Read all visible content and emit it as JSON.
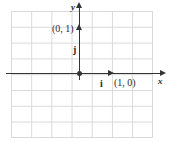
{
  "figure": {
    "type": "coordinate-plane-diagram",
    "background_color": "#ffffff",
    "grid_color": "#d9d9d9",
    "axis_color": "#333333",
    "label_color": "#2b2b2b"
  },
  "axes": {
    "x_label": "x",
    "y_label": "y",
    "x_arrow": "arrowhead-right",
    "y_arrow": "arrowhead-up",
    "origin_marker": "dot"
  },
  "labels": {
    "point_0_1": "(0, 1)",
    "point_1_0": "(1, 0)",
    "vector_i": "i",
    "vector_j": "j"
  },
  "chart_data": {
    "type": "scatter",
    "title": "",
    "xlabel": "x",
    "ylabel": "y",
    "grid": true,
    "legend": "none",
    "xlim": [
      -3.5,
      3.5
    ],
    "ylim": [
      -3,
      4
    ],
    "vectors": [
      {
        "name": "i",
        "label": "(1, 0)",
        "from": [
          0,
          0
        ],
        "to": [
          1,
          0
        ]
      },
      {
        "name": "j",
        "label": "(0, 1)",
        "from": [
          0,
          0
        ],
        "to": [
          0,
          1
        ]
      }
    ],
    "points": [
      {
        "label": "(1, 0)",
        "x": 1,
        "y": 0
      },
      {
        "label": "(0, 1)",
        "x": 0,
        "y": 1
      }
    ]
  }
}
